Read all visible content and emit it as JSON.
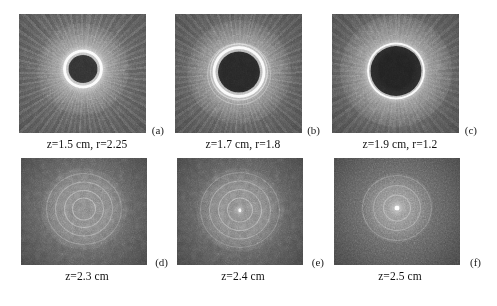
{
  "figure": {
    "type": "grayscale-image-grid",
    "rows": 2,
    "columns": 3,
    "background_color": "#ffffff",
    "text_color": "#111111"
  },
  "panels": [
    {
      "label": "(a)",
      "caption": "z=1.5 cm, r=2.25",
      "z_cm": "1.5",
      "r": "2.25",
      "description": "dark circular core with single bright ring, grainy radial-streak halo",
      "core_diameter_px": 30,
      "ring_thickness_px": 4,
      "ring_count": 1,
      "core_brightness": "dark",
      "field_brightness": "mid-gray"
    },
    {
      "label": "(b)",
      "caption": "z=1.7 cm, r=1.8",
      "z_cm": "1.7",
      "r": "1.8",
      "description": "larger dark core with bright inner ring and fainter secondary outer ring",
      "core_diameter_px": 44,
      "ring_thickness_px": 4,
      "ring_count": 2,
      "core_brightness": "very dark",
      "field_brightness": "mid-gray"
    },
    {
      "label": "(c)",
      "caption": "z=1.9 cm, r=1.2",
      "z_cm": "1.9",
      "r": "1.2",
      "description": "largest dark core with thin crisp bright ring",
      "core_diameter_px": 52,
      "ring_thickness_px": 3,
      "ring_count": 1,
      "core_brightness": "very dark",
      "field_brightness": "mid-gray"
    },
    {
      "label": "(d)",
      "caption": "z=2.3 cm",
      "z_cm": "2.3",
      "r": "",
      "description": "faint concentric diffraction rings, no dark core, low contrast",
      "core_diameter_px": 0,
      "ring_thickness_px": 2,
      "ring_count": 4,
      "core_brightness": "none",
      "field_brightness": "dark-gray"
    },
    {
      "label": "(e)",
      "caption": "z=2.4 cm",
      "z_cm": "2.4",
      "r": "",
      "description": "concentric rings with small bright point at centre",
      "core_diameter_px": 0,
      "ring_thickness_px": 2,
      "ring_count": 4,
      "core_brightness": "bright-point",
      "field_brightness": "dark-gray"
    },
    {
      "label": "(f)",
      "caption": "z=2.5 cm",
      "z_cm": "2.5",
      "r": "",
      "description": "distinct bright central spot with faint surrounding rings",
      "core_diameter_px": 0,
      "ring_thickness_px": 2,
      "ring_count": 3,
      "core_brightness": "bright-spot",
      "field_brightness": "dark-gray"
    }
  ]
}
